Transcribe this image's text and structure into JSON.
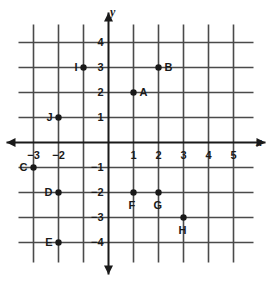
{
  "chart_data": {
    "type": "scatter",
    "title": "",
    "xlabel": "x",
    "ylabel": "y",
    "xlim": [
      -3.6,
      5.8
    ],
    "ylim": [
      -4.8,
      4.8
    ],
    "grid": true,
    "legend": "none",
    "x_ticks": [
      {
        "value": -3,
        "label": "−3"
      },
      {
        "value": -2,
        "label": "−2"
      },
      {
        "value": -1,
        "label": ""
      },
      {
        "value": 1,
        "label": "1"
      },
      {
        "value": 2,
        "label": "2"
      },
      {
        "value": 3,
        "label": "3"
      },
      {
        "value": 4,
        "label": "4"
      },
      {
        "value": 5,
        "label": "5"
      }
    ],
    "y_ticks": [
      {
        "value": 4,
        "label": "4"
      },
      {
        "value": 3,
        "label": "3"
      },
      {
        "value": 2,
        "label": "2"
      },
      {
        "value": 1,
        "label": "1"
      },
      {
        "value": -1,
        "label": "−1"
      },
      {
        "value": -2,
        "label": "−2"
      },
      {
        "value": -3,
        "label": "−3"
      },
      {
        "value": -4,
        "label": "−4"
      }
    ],
    "points": [
      {
        "label": "A",
        "x": 1,
        "y": 2,
        "label_pos": "right"
      },
      {
        "label": "B",
        "x": 2,
        "y": 3,
        "label_pos": "right"
      },
      {
        "label": "C",
        "x": -3,
        "y": -1,
        "label_pos": "left"
      },
      {
        "label": "D",
        "x": -2,
        "y": -2,
        "label_pos": "left"
      },
      {
        "label": "E",
        "x": -2,
        "y": -4,
        "label_pos": "left"
      },
      {
        "label": "F",
        "x": 1,
        "y": -2,
        "label_pos": "below"
      },
      {
        "label": "G",
        "x": 2,
        "y": -2,
        "label_pos": "below"
      },
      {
        "label": "H",
        "x": 3,
        "y": -3,
        "label_pos": "below"
      },
      {
        "label": "I",
        "x": -1,
        "y": 3,
        "label_pos": "left"
      },
      {
        "label": "J",
        "x": -2,
        "y": 1,
        "label_pos": "left"
      }
    ],
    "colors": {
      "background": "#ffffff",
      "grid": "#4a4a4a",
      "axis": "#1a1a1a",
      "point": "#1a1a1a",
      "text": "#1a1a1a"
    }
  }
}
